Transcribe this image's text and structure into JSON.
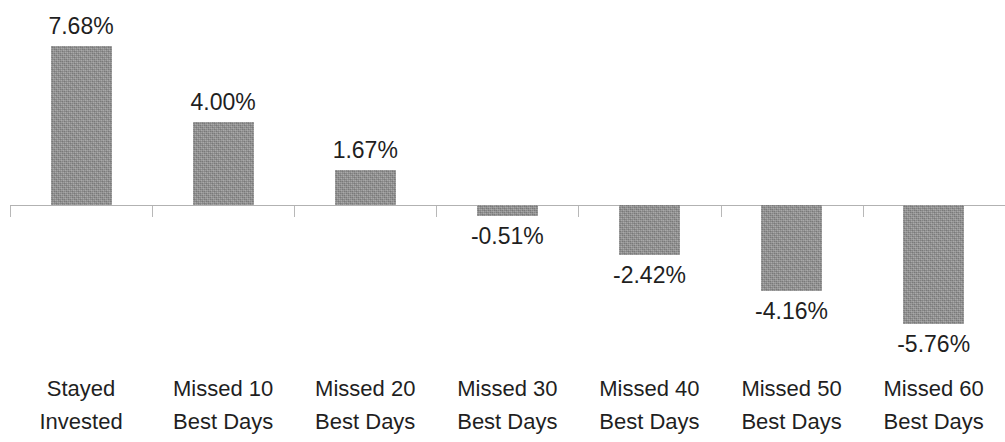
{
  "chart_data": {
    "type": "bar",
    "title": "",
    "subtitle": "",
    "xlabel": "",
    "ylabel": "",
    "grid": false,
    "legend": false,
    "zero_line": true,
    "value_label_format": "0.00%",
    "axis_color": "#b2b2b2",
    "bar_color": "#919191",
    "text_color": "#1f1f1f",
    "ylim": [
      -6.5,
      8.5
    ],
    "categories": [
      "Stayed Invested",
      "Missed 10 Best Days",
      "Missed 20 Best Days",
      "Missed 30 Best Days",
      "Missed 40 Best Days",
      "Missed 50 Best Days",
      "Missed 60 Best Days"
    ],
    "category_lines": [
      [
        "Stayed",
        "Invested"
      ],
      [
        "Missed 10",
        "Best Days"
      ],
      [
        "Missed 20",
        "Best Days"
      ],
      [
        "Missed 30",
        "Best Days"
      ],
      [
        "Missed 40",
        "Best Days"
      ],
      [
        "Missed 50",
        "Best Days"
      ],
      [
        "Missed 60",
        "Best Days"
      ]
    ],
    "values": [
      7.68,
      4.0,
      1.67,
      -0.51,
      -2.42,
      -4.16,
      -5.76
    ],
    "value_labels": [
      "7.68%",
      "4.00%",
      "1.67%",
      "-0.51%",
      "-2.42%",
      "-4.16%",
      "-5.76%"
    ]
  },
  "bars": [
    {
      "label": "7.68%",
      "line1": "Stayed",
      "line2": "Invested",
      "value": 7.68
    },
    {
      "label": "4.00%",
      "line1": "Missed 10",
      "line2": "Best Days",
      "value": 4.0
    },
    {
      "label": "1.67%",
      "line1": "Missed 20",
      "line2": "Best Days",
      "value": 1.67
    },
    {
      "label": "-0.51%",
      "line1": "Missed 30",
      "line2": "Best Days",
      "value": -0.51
    },
    {
      "label": "-2.42%",
      "line1": "Missed 40",
      "line2": "Best Days",
      "value": -2.42
    },
    {
      "label": "-4.16%",
      "line1": "Missed 50",
      "line2": "Best Days",
      "value": -4.16
    },
    {
      "label": "-5.76%",
      "line1": "Missed 60",
      "line2": "Best Days",
      "value": -5.76
    }
  ]
}
